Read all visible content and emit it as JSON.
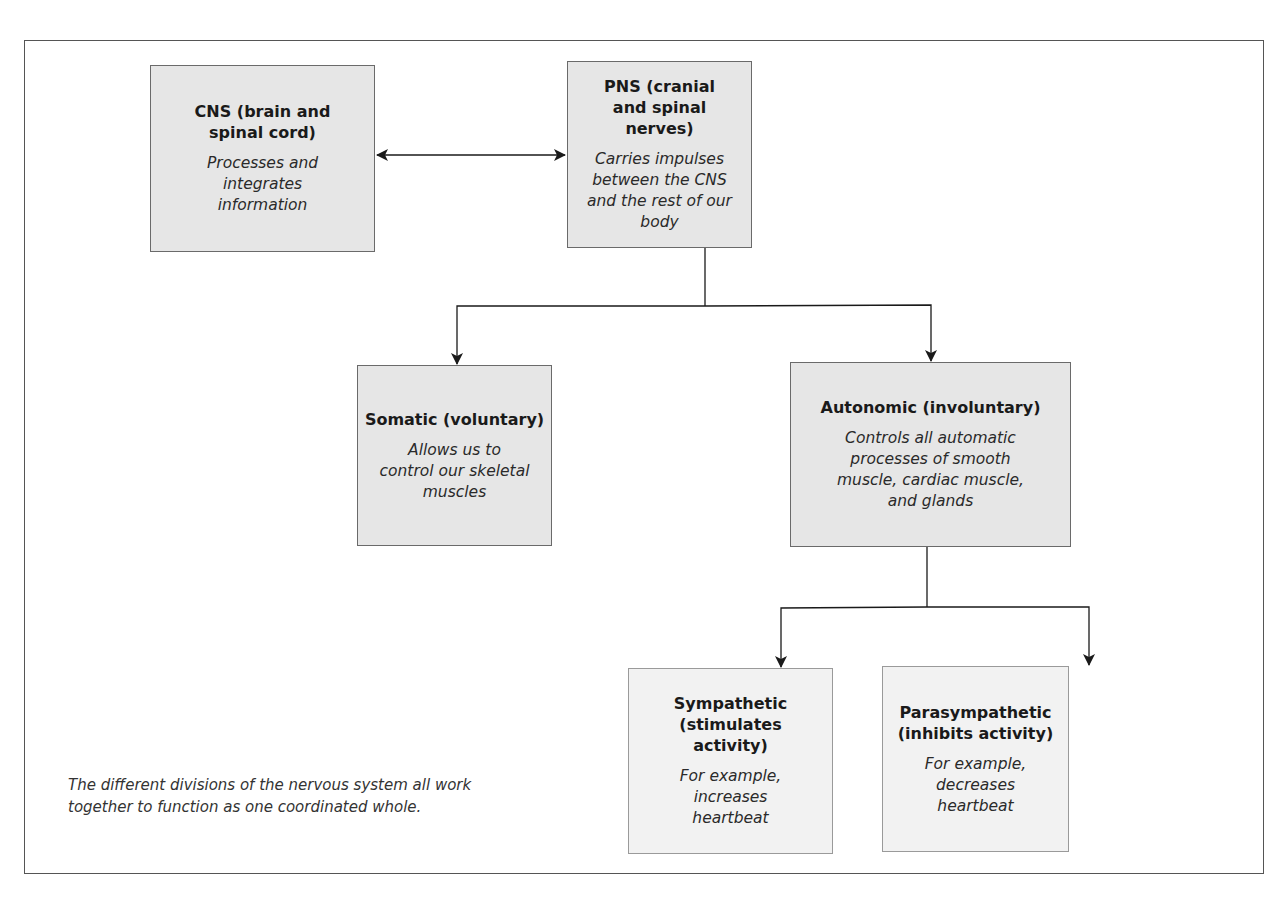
{
  "diagram": {
    "caption": "The different divisions of the nervous system all work together to function as one coordinated whole.",
    "nodes": {
      "cns": {
        "title": "CNS (brain and spinal cord)",
        "description": "Processes and integrates information"
      },
      "pns": {
        "title": "PNS (cranial and spinal nerves)",
        "description": "Carries impulses between the CNS and the rest of our body"
      },
      "somatic": {
        "title": "Somatic (voluntary)",
        "description": "Allows us to control our skeletal muscles"
      },
      "autonomic": {
        "title": "Autonomic (involuntary)",
        "description": "Controls all automatic processes of smooth muscle, cardiac muscle, and glands"
      },
      "sympathetic": {
        "title": "Sympathetic (stimulates activity)",
        "description": "For example, increases heartbeat"
      },
      "parasympathetic": {
        "title": "Parasympathetic (inhibits activity)",
        "description": "For example, decreases heartbeat"
      }
    },
    "edges": [
      {
        "from": "cns",
        "to": "pns",
        "type": "bidirectional-arrow"
      },
      {
        "from": "pns",
        "to": "somatic",
        "type": "arrow"
      },
      {
        "from": "pns",
        "to": "autonomic",
        "type": "arrow"
      },
      {
        "from": "autonomic",
        "to": "sympathetic",
        "type": "arrow"
      },
      {
        "from": "autonomic",
        "to": "parasympathetic",
        "type": "arrow"
      }
    ],
    "colors": {
      "box_fill_primary": "#e6e6e6",
      "box_fill_secondary": "#f2f2f2",
      "line": "#1a1a1a",
      "frame": "#555555"
    }
  }
}
